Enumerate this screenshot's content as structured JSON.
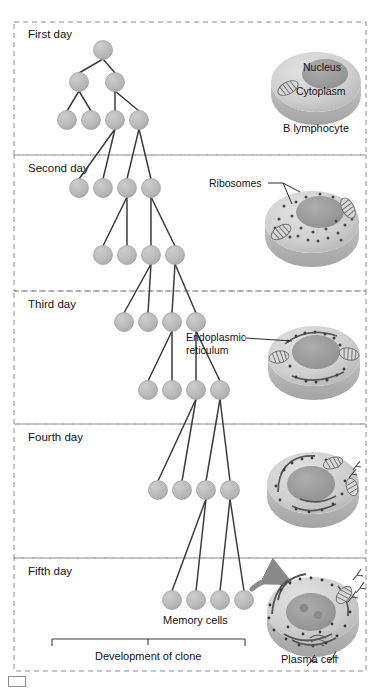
{
  "figure": {
    "type": "biology-diagram",
    "width": 380,
    "height": 693
  },
  "sections": [
    {
      "id": "first",
      "label": "First day",
      "y_top": 22,
      "y_bottom": 155
    },
    {
      "id": "second",
      "label": "Second day",
      "y_top": 155,
      "y_bottom": 291
    },
    {
      "id": "third",
      "label": "Third day",
      "y_top": 291,
      "y_bottom": 424
    },
    {
      "id": "fourth",
      "label": "Fourth day",
      "y_top": 424,
      "y_bottom": 558
    },
    {
      "id": "fifth",
      "label": "Fifth day",
      "y_top": 558,
      "y_bottom": 671
    }
  ],
  "cells": [
    {
      "id": "b-lymphocyte",
      "caption": "B lymphocyte",
      "organelle_labels": [
        "Nucleus",
        "Cytoplasm"
      ],
      "day": "First day",
      "features": {
        "ribosomes": 0,
        "mitochondria": 1,
        "er": false,
        "antibodies": 0
      }
    },
    {
      "id": "day2-cell",
      "caption": "",
      "organelle_labels": [
        "Ribosomes"
      ],
      "day": "Second day",
      "features": {
        "ribosomes": 28,
        "mitochondria": 2,
        "er": false,
        "antibodies": 0
      }
    },
    {
      "id": "day3-cell",
      "caption": "",
      "organelle_labels": [
        "Endoplasmic",
        "reticulum"
      ],
      "day": "Third day",
      "features": {
        "ribosomes": 20,
        "mitochondria": 2,
        "er": true,
        "antibodies": 0
      }
    },
    {
      "id": "day4-cell",
      "caption": "",
      "organelle_labels": [],
      "day": "Fourth day",
      "features": {
        "ribosomes": 24,
        "mitochondria": 3,
        "er": true,
        "antibodies": 2
      }
    },
    {
      "id": "plasma-cell",
      "caption": "Plasma cell",
      "organelle_labels": [],
      "day": "Fifth day",
      "features": {
        "ribosomes": 40,
        "mitochondria": 2,
        "er": true,
        "antibodies": 5
      }
    }
  ],
  "annotations": {
    "nucleus": "Nucleus",
    "cytoplasm": "Cytoplasm",
    "b_lymphocyte": "B lymphocyte",
    "ribosomes": "Ribosomes",
    "endoplasmic_line1": "Endoplasmic",
    "endoplasmic_line2": "reticulum",
    "memory_cells": "Memory cells",
    "development_of_clone": "Development of clone",
    "plasma_cell": "Plasma cell"
  },
  "clone_tree": {
    "description": "Binary division tree of B cells; each day the lineage doubles and shifts right",
    "rows": [
      {
        "day": "First day",
        "y": 50,
        "nodes": [
          103
        ]
      },
      {
        "day": "First day",
        "y": 82,
        "nodes": [
          79,
          115
        ]
      },
      {
        "day": "First day",
        "y": 120,
        "nodes": [
          67,
          91,
          115,
          139
        ]
      },
      {
        "day": "Second day",
        "y": 188,
        "nodes": [
          79,
          103,
          127,
          151
        ]
      },
      {
        "day": "Second day",
        "y": 255,
        "nodes": [
          103,
          127,
          151,
          175
        ]
      },
      {
        "day": "Third day",
        "y": 322,
        "nodes": [
          124,
          148,
          172,
          196
        ]
      },
      {
        "day": "Third day",
        "y": 390,
        "nodes": [
          148,
          172,
          196,
          220
        ]
      },
      {
        "day": "Fourth day",
        "y": 490,
        "nodes": [
          158,
          182,
          206,
          230
        ]
      },
      {
        "day": "Fifth day",
        "y": 600,
        "nodes": [
          172,
          196,
          220,
          244
        ]
      }
    ],
    "node_radius": 9.5
  },
  "colors": {
    "background": "#ffffff",
    "node_fill": "#b9b9b9",
    "node_stroke": "#a0a0a0",
    "line": "#3c3c3c",
    "section_border": "#8c8c8c",
    "text": "#141414",
    "cell_body": "#cfcfcf",
    "cell_rim": "#bcbcbc",
    "nucleus": "#9a9a9a",
    "arrow": "#8a8a8a"
  }
}
